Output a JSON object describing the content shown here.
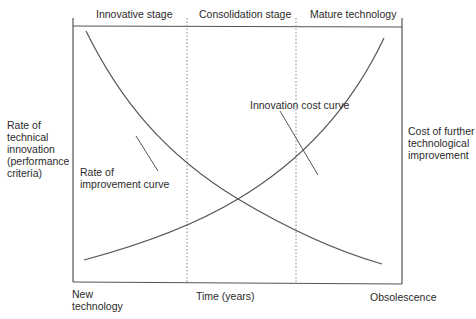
{
  "diagram": {
    "stages": [
      {
        "label": "Innovative stage"
      },
      {
        "label": "Consolidation stage"
      },
      {
        "label": "Mature technology"
      }
    ],
    "left_axis_label": "Rate of\ntechnical\ninnovation\n(performance\ncriteria)",
    "right_axis_label": "Cost of further\ntechnological\nimprovement",
    "x_axis": {
      "start_label": "New\ntechnology",
      "center_label": "Time (years)",
      "end_label": "Obsolescence"
    },
    "curves": [
      {
        "name": "Rate of improvement curve",
        "label": "Rate of\nimprovement curve",
        "trend": "decreasing"
      },
      {
        "name": "Innovation cost curve",
        "label": "Innovation cost curve",
        "trend": "increasing"
      }
    ],
    "colors": {
      "line": "#555555",
      "divider": "#888888",
      "text": "#2b2b2b"
    }
  }
}
